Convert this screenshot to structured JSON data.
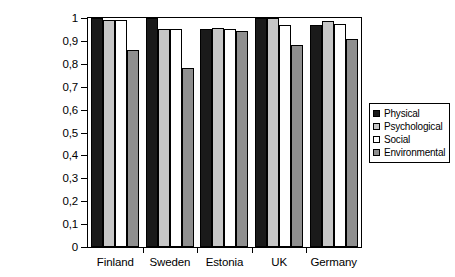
{
  "chart_data": {
    "type": "bar",
    "title": "",
    "subtitle": "",
    "xlabel": "",
    "ylabel": "",
    "ylim": [
      0,
      1
    ],
    "grid": false,
    "legend_position": "right",
    "categories": [
      "Finland",
      "Sweden",
      "Estonia",
      "UK",
      "Germany"
    ],
    "y_ticks": [
      {
        "value": 1,
        "label": "1"
      },
      {
        "value": 0.9,
        "label": "0,9"
      },
      {
        "value": 0.8,
        "label": "0,8"
      },
      {
        "value": 0.7,
        "label": "0,7"
      },
      {
        "value": 0.6,
        "label": "0,6"
      },
      {
        "value": 0.5,
        "label": "0,5"
      },
      {
        "value": 0.4,
        "label": "0,4"
      },
      {
        "value": 0.3,
        "label": "0,3"
      },
      {
        "value": 0.2,
        "label": "0,2"
      },
      {
        "value": 0.1,
        "label": "0,1"
      },
      {
        "value": 0,
        "label": "0"
      }
    ],
    "series": [
      {
        "name": "Physical",
        "color": "#1a1a1a",
        "values": [
          1.0,
          1.0,
          0.95,
          1.0,
          0.97
        ]
      },
      {
        "name": "Psychological",
        "color": "#c6c6c6",
        "values": [
          0.99,
          0.95,
          0.955,
          1.0,
          0.985
        ]
      },
      {
        "name": "Social",
        "color": "#ffffff",
        "values": [
          0.99,
          0.95,
          0.95,
          0.97,
          0.975
        ]
      },
      {
        "name": "Environmental",
        "color": "#8f8f8f",
        "values": [
          0.86,
          0.78,
          0.945,
          0.88,
          0.91
        ]
      }
    ]
  },
  "legend": {
    "items": [
      {
        "label": "Physical",
        "color": "#1a1a1a"
      },
      {
        "label": "Psychological",
        "color": "#c6c6c6"
      },
      {
        "label": "Social",
        "color": "#ffffff"
      },
      {
        "label": "Environmental",
        "color": "#8f8f8f"
      }
    ]
  }
}
